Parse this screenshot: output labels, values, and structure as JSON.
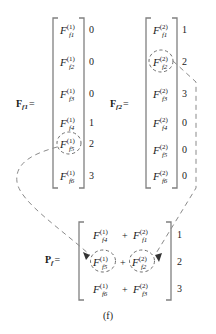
{
  "figure": {
    "caption": "(f)",
    "bottom_artifact": "",
    "bracket_color": "#808080",
    "dash_color": "#8a8a8a",
    "text_color": "#1a1a1a"
  },
  "matrix_f1": {
    "label_base": "F",
    "label_sub": "f1",
    "equals": "=",
    "rows": [
      {
        "base": "F",
        "sup": "(1)",
        "sub": "f1",
        "index": "0",
        "circled": false
      },
      {
        "base": "F",
        "sup": "(1)",
        "sub": "f2",
        "index": "0",
        "circled": false
      },
      {
        "base": "F",
        "sup": "(1)",
        "sub": "f3",
        "index": "0",
        "circled": false
      },
      {
        "base": "F",
        "sup": "(1)",
        "sub": "f4",
        "index": "1",
        "circled": false
      },
      {
        "base": "F",
        "sup": "(1)",
        "sub": "f5",
        "index": "2",
        "circled": true
      },
      {
        "base": "F",
        "sup": "(1)",
        "sub": "f6",
        "index": "3",
        "circled": false
      }
    ]
  },
  "matrix_f2": {
    "label_base": "F",
    "label_sub": "f2",
    "equals": "=",
    "rows": [
      {
        "base": "F",
        "sup": "(2)",
        "sub": "f1",
        "index": "1",
        "circled": false
      },
      {
        "base": "F",
        "sup": "(2)",
        "sub": "f2",
        "index": "2",
        "circled": true
      },
      {
        "base": "F",
        "sup": "(2)",
        "sub": "f3",
        "index": "3",
        "circled": false
      },
      {
        "base": "F",
        "sup": "(2)",
        "sub": "f4",
        "index": "0",
        "circled": false
      },
      {
        "base": "F",
        "sup": "(2)",
        "sub": "f5",
        "index": "0",
        "circled": false
      },
      {
        "base": "F",
        "sup": "(2)",
        "sub": "f6",
        "index": "0",
        "circled": false
      }
    ]
  },
  "matrix_p": {
    "label_base": "P",
    "label_sub": "f",
    "equals": "=",
    "plus": "+",
    "rows": [
      {
        "left": {
          "base": "F",
          "sup": "(1)",
          "sub": "f4",
          "circled": false
        },
        "right": {
          "base": "F",
          "sup": "(2)",
          "sub": "f1",
          "circled": false
        },
        "index": "1"
      },
      {
        "left": {
          "base": "F",
          "sup": "(1)",
          "sub": "f5",
          "circled": true
        },
        "right": {
          "base": "F",
          "sup": "(2)",
          "sub": "f2",
          "circled": true
        },
        "index": "2"
      },
      {
        "left": {
          "base": "F",
          "sup": "(1)",
          "sub": "f6",
          "circled": false
        },
        "right": {
          "base": "F",
          "sup": "(2)",
          "sub": "f3",
          "circled": false
        },
        "index": "3"
      }
    ]
  },
  "connectors": [
    {
      "name": "f1-f5-to-p-f5",
      "from": "matrix_f1.rows.4",
      "to": "matrix_p.rows.1.left"
    },
    {
      "name": "f2-f2-to-p-f2",
      "from": "matrix_f2.rows.1",
      "to": "matrix_p.rows.1.right"
    }
  ]
}
